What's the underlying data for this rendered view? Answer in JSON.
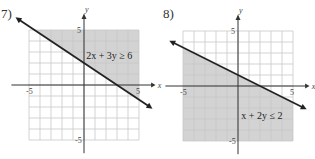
{
  "chart_data": [
    {
      "type": "line",
      "problem_label": "7)",
      "title": "2x + 3y ≥ 6",
      "inequality": {
        "a": 2,
        "b": 3,
        "c": 6,
        "op": ">="
      },
      "shade": "above",
      "boundary": "solid",
      "xlabel": "x",
      "ylabel": "y",
      "xlim": [
        -5,
        5
      ],
      "ylim": [
        -5,
        5
      ],
      "tick_labels": {
        "x": [
          "-5",
          "5"
        ],
        "y": [
          "5",
          "-5"
        ]
      },
      "grid": true,
      "annotation_position": "upper-right"
    },
    {
      "type": "line",
      "problem_label": "8)",
      "title": "x + 2y ≤ 2",
      "inequality": {
        "a": 1,
        "b": 2,
        "c": 2,
        "op": "<="
      },
      "shade": "below",
      "boundary": "solid",
      "xlabel": "x",
      "ylabel": "y",
      "xlim": [
        -5,
        5
      ],
      "ylim": [
        -5,
        5
      ],
      "tick_labels": {
        "x": [
          "-5",
          "5"
        ],
        "y": [
          "5",
          "-5"
        ]
      },
      "grid": true,
      "annotation_position": "lower-right"
    }
  ],
  "colors": {
    "shade": "#d3d3d3",
    "grid": "#c8c8c8",
    "axis": "#333333",
    "line": "#222222"
  }
}
